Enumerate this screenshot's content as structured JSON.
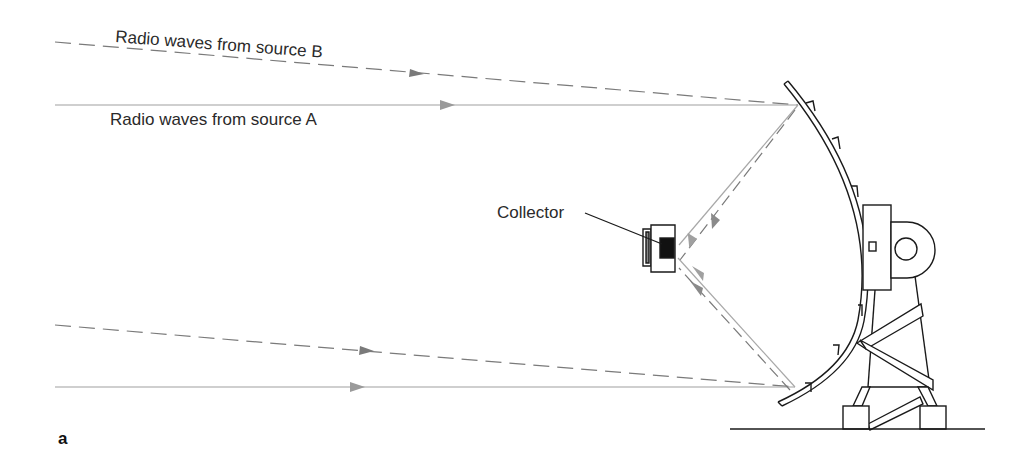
{
  "figure": {
    "panel_label": "a",
    "labels": {
      "source_b": "Radio waves from source B",
      "source_a": "Radio waves from source A",
      "collector": "Collector"
    },
    "colors": {
      "ray_solid": "#9a9a9a",
      "ray_dashed": "#7a7a7a",
      "outline": "#1a1a1a",
      "collector_fill": "#111111",
      "background": "#ffffff"
    },
    "rays": [
      {
        "name": "source-b-upper",
        "style": "dashed",
        "from": [
          55,
          42
        ],
        "to": [
          798,
          105
        ]
      },
      {
        "name": "source-a-upper",
        "style": "solid",
        "from": [
          55,
          105
        ],
        "to": [
          798,
          105
        ]
      },
      {
        "name": "source-b-lower",
        "style": "dashed",
        "from": [
          55,
          325
        ],
        "to": [
          795,
          387
        ]
      },
      {
        "name": "source-a-lower",
        "style": "solid",
        "from": [
          55,
          387
        ],
        "to": [
          795,
          387
        ]
      }
    ]
  }
}
